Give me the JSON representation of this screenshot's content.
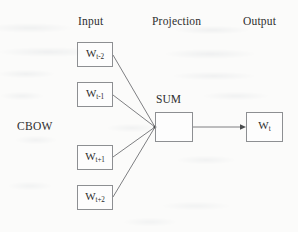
{
  "figure": {
    "model_label": "CBOW",
    "columns": [
      {
        "name": "input",
        "label": "Input",
        "x": 78,
        "y": 15
      },
      {
        "name": "projection",
        "label": "Projection",
        "x": 152,
        "y": 15
      },
      {
        "name": "output",
        "label": "Output",
        "x": 243,
        "y": 15
      }
    ],
    "projection_label": "SUM",
    "input_nodes": [
      {
        "name": "w-t-minus-2",
        "base": "W",
        "sub": "t-2",
        "x": 77,
        "y": 42,
        "w": 36,
        "h": 25
      },
      {
        "name": "w-t-minus-1",
        "base": "W",
        "sub": "t-1",
        "x": 77,
        "y": 82,
        "w": 36,
        "h": 25
      },
      {
        "name": "w-t-plus-1",
        "base": "W",
        "sub": "t+1",
        "x": 77,
        "y": 145,
        "w": 36,
        "h": 25
      },
      {
        "name": "w-t-plus-2",
        "base": "W",
        "sub": "t+2",
        "x": 77,
        "y": 185,
        "w": 36,
        "h": 25
      }
    ],
    "projection_node": {
      "name": "sum-node",
      "x": 155,
      "y": 112,
      "w": 38,
      "h": 30
    },
    "output_node": {
      "name": "w-t",
      "base": "W",
      "sub": "t",
      "x": 246,
      "y": 112,
      "w": 37,
      "h": 30
    },
    "converge_point": {
      "x": 155,
      "y": 127
    },
    "colors": {
      "background": "#fbfbfa",
      "box_border": "#8d8f92",
      "edge": "#6f7174",
      "text": "#2b2b2b"
    }
  }
}
